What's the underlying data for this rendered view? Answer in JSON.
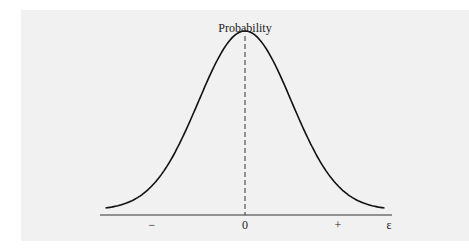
{
  "chart_data": {
    "type": "line",
    "title": "",
    "ylabel": "Probability",
    "xlabel": "ε",
    "x_tick_labels": [
      "−",
      "0",
      "+"
    ],
    "x_tick_values": [
      -1,
      0,
      1
    ],
    "xlim": [
      -1.5,
      1.5
    ],
    "ylim": [
      0,
      1
    ],
    "grid": false,
    "legend": "none",
    "series": [
      {
        "name": "error distribution",
        "kind": "gaussian",
        "mean": 0,
        "sd": 0.5,
        "peak": 1.0
      }
    ],
    "annotations": [
      {
        "type": "vertical-dashed-line",
        "x": 0,
        "label": "Probability"
      }
    ]
  },
  "colors": {
    "panel": "#f1f1f1",
    "ink": "#111111"
  }
}
